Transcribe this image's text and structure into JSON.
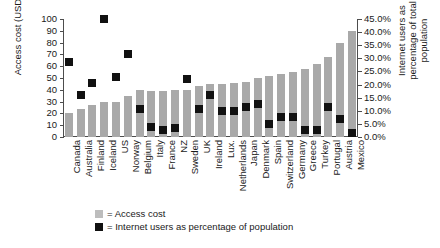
{
  "chart_data": {
    "type": "bar",
    "title": "",
    "subtitle": "",
    "categories": [
      "Canada",
      "Australia",
      "Finland",
      "Iceland",
      "US",
      "Norway",
      "Belgium",
      "Italy",
      "France",
      "NZ",
      "Sweden",
      "UK",
      "Ireland",
      "Lux.",
      "Netherlands",
      "Japan",
      "Denmark",
      "Spain",
      "Switzerland",
      "Germany",
      "Greece",
      "Turkey",
      "Portugal",
      "Austria",
      "Mexico"
    ],
    "series": [
      {
        "name": "Access cost",
        "axis": "left",
        "type": "bar",
        "color": "#a9a9a9",
        "values": [
          20,
          24,
          27,
          30,
          30,
          35,
          40,
          39,
          39,
          40,
          40,
          43,
          45,
          45,
          46,
          47,
          50,
          52,
          53,
          55,
          58,
          62,
          68,
          80,
          90
        ]
      },
      {
        "name": "Internet users as percentage of population",
        "axis": "right",
        "type": "scatter",
        "marker": "square",
        "color": "#111111",
        "values": [
          0.285,
          0.16,
          0.205,
          0.45,
          0.23,
          0.315,
          0.105,
          0.04,
          0.025,
          0.035,
          0.22,
          0.105,
          0.16,
          0.1,
          0.1,
          0.115,
          0.125,
          0.05,
          0.075,
          0.075,
          0.025,
          0.025,
          0.115,
          0.07,
          0.015
        ]
      }
    ],
    "yaxis_left": {
      "label": "Access cost (USD)",
      "min": 0,
      "max": 100,
      "tick_step": 10,
      "ticks": [
        "0",
        "10",
        "20",
        "30",
        "40",
        "50",
        "60",
        "70",
        "80",
        "90",
        "100"
      ]
    },
    "yaxis_right": {
      "label": "Internet users as percentage of total population",
      "min": 0,
      "max": 0.45,
      "tick_step": 0.05,
      "ticks": [
        "0.0%",
        "5.0%",
        "10.0%",
        "15.0%",
        "20.0%",
        "25.0%",
        "30.0%",
        "35.0%",
        "40.0%",
        "45.0%"
      ]
    },
    "xaxis": {
      "label": ""
    },
    "grid": false,
    "legend_position": "bottom-left",
    "legend": [
      {
        "marker": "gray-square",
        "text": "= Access cost"
      },
      {
        "marker": "black-square",
        "text": "= Internet users as percentage of population"
      }
    ]
  }
}
